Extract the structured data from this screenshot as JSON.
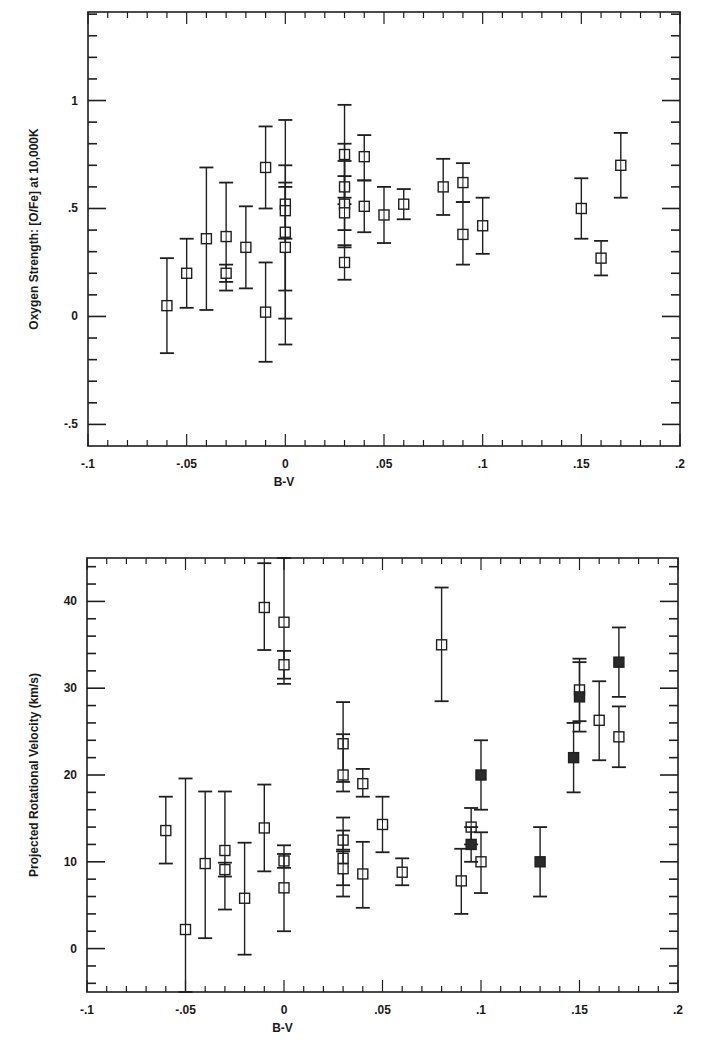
{
  "chart_data": [
    {
      "type": "scatter",
      "title": "",
      "xlabel": "B-V",
      "ylabel": "Oxygen Strength:  [O/Fe] at 10,000K",
      "xlim": [
        -0.1,
        0.2
      ],
      "ylim": [
        -0.6,
        1.41
      ],
      "xticks": [
        -0.1,
        -0.05,
        0,
        0.05,
        0.1,
        0.15,
        0.2
      ],
      "xtick_labels": [
        "-.1",
        "-.05",
        "0",
        ".05",
        ".1",
        ".15",
        ".2"
      ],
      "yticks": [
        -0.5,
        0,
        0.5,
        1
      ],
      "ytick_labels": [
        "-.5",
        "0",
        ".5",
        "1"
      ],
      "grid": false,
      "legend": null,
      "marker": "open-square-with-errorbars",
      "series": [
        {
          "name": "open",
          "filled": false,
          "points": [
            {
              "x": -0.06,
              "y": 0.05,
              "ylo": -0.17,
              "yhi": 0.27
            },
            {
              "x": -0.05,
              "y": 0.2,
              "ylo": 0.04,
              "yhi": 0.36
            },
            {
              "x": -0.04,
              "y": 0.36,
              "ylo": 0.03,
              "yhi": 0.69
            },
            {
              "x": -0.03,
              "y": 0.37,
              "ylo": 0.12,
              "yhi": 0.62
            },
            {
              "x": -0.03,
              "y": 0.2,
              "ylo": 0.16,
              "yhi": 0.24
            },
            {
              "x": -0.02,
              "y": 0.32,
              "ylo": 0.13,
              "yhi": 0.51
            },
            {
              "x": -0.01,
              "y": 0.69,
              "ylo": 0.5,
              "yhi": 0.88
            },
            {
              "x": -0.01,
              "y": 0.02,
              "ylo": -0.21,
              "yhi": 0.25
            },
            {
              "x": 0.0,
              "y": 0.52,
              "ylo": 0.12,
              "yhi": 0.91
            },
            {
              "x": 0.0,
              "y": 0.49,
              "ylo": 0.36,
              "yhi": 0.62
            },
            {
              "x": 0.0,
              "y": 0.39,
              "ylo": -0.01,
              "yhi": 0.7
            },
            {
              "x": 0.0,
              "y": 0.32,
              "ylo": -0.13,
              "yhi": 0.6
            },
            {
              "x": 0.03,
              "y": 0.75,
              "ylo": 0.52,
              "yhi": 0.98
            },
            {
              "x": 0.03,
              "y": 0.6,
              "ylo": 0.55,
              "yhi": 0.65
            },
            {
              "x": 0.03,
              "y": 0.52,
              "ylo": 0.32,
              "yhi": 0.72
            },
            {
              "x": 0.03,
              "y": 0.48,
              "ylo": 0.4,
              "yhi": 0.8
            },
            {
              "x": 0.03,
              "y": 0.25,
              "ylo": 0.17,
              "yhi": 0.33
            },
            {
              "x": 0.04,
              "y": 0.74,
              "ylo": 0.63,
              "yhi": 0.84
            },
            {
              "x": 0.04,
              "y": 0.51,
              "ylo": 0.39,
              "yhi": 0.63
            },
            {
              "x": 0.05,
              "y": 0.47,
              "ylo": 0.34,
              "yhi": 0.6
            },
            {
              "x": 0.06,
              "y": 0.52,
              "ylo": 0.45,
              "yhi": 0.59
            },
            {
              "x": 0.08,
              "y": 0.6,
              "ylo": 0.47,
              "yhi": 0.73
            },
            {
              "x": 0.09,
              "y": 0.62,
              "ylo": 0.53,
              "yhi": 0.71
            },
            {
              "x": 0.09,
              "y": 0.38,
              "ylo": 0.24,
              "yhi": 0.53
            },
            {
              "x": 0.1,
              "y": 0.42,
              "ylo": 0.29,
              "yhi": 0.55
            },
            {
              "x": 0.15,
              "y": 0.5,
              "ylo": 0.36,
              "yhi": 0.64
            },
            {
              "x": 0.16,
              "y": 0.27,
              "ylo": 0.19,
              "yhi": 0.35
            },
            {
              "x": 0.17,
              "y": 0.7,
              "ylo": 0.55,
              "yhi": 0.85
            }
          ]
        }
      ]
    },
    {
      "type": "scatter",
      "title": "",
      "xlabel": "B-V",
      "ylabel": "Projected Rotational Velocity (km/s)",
      "xlim": [
        -0.1,
        0.2
      ],
      "ylim": [
        -5,
        45
      ],
      "xticks": [
        -0.1,
        -0.05,
        0,
        0.05,
        0.1,
        0.15,
        0.2
      ],
      "xtick_labels": [
        "-.1",
        "-.05",
        "0",
        ".05",
        ".1",
        ".15",
        ".2"
      ],
      "yticks": [
        0,
        10,
        20,
        30,
        40
      ],
      "ytick_labels": [
        "0",
        "10",
        "20",
        "30",
        "40"
      ],
      "grid": false,
      "legend": null,
      "marker": "square-with-errorbars",
      "series": [
        {
          "name": "open",
          "filled": false,
          "points": [
            {
              "x": -0.06,
              "y": 13.6,
              "ylo": 9.8,
              "yhi": 17.5
            },
            {
              "x": -0.05,
              "y": 2.2,
              "ylo": -5.0,
              "yhi": 19.6
            },
            {
              "x": -0.04,
              "y": 9.8,
              "ylo": 1.2,
              "yhi": 18.1
            },
            {
              "x": -0.03,
              "y": 11.3,
              "ylo": 4.5,
              "yhi": 18.1
            },
            {
              "x": -0.03,
              "y": 9.1,
              "ylo": 8.3,
              "yhi": 9.9
            },
            {
              "x": -0.02,
              "y": 5.8,
              "ylo": -0.7,
              "yhi": 12.2
            },
            {
              "x": -0.01,
              "y": 39.3,
              "ylo": 34.4,
              "yhi": 44.4
            },
            {
              "x": -0.01,
              "y": 13.9,
              "ylo": 8.9,
              "yhi": 18.9
            },
            {
              "x": 0.0,
              "y": 37.6,
              "ylo": 30.5,
              "yhi": 45.0
            },
            {
              "x": 0.0,
              "y": 32.7,
              "ylo": 31.1,
              "yhi": 34.3
            },
            {
              "x": 0.0,
              "y": 10.1,
              "ylo": 9.3,
              "yhi": 10.9
            },
            {
              "x": 0.0,
              "y": 7.0,
              "ylo": 2.0,
              "yhi": 11.9
            },
            {
              "x": 0.03,
              "y": 23.6,
              "ylo": 19.2,
              "yhi": 28.4
            },
            {
              "x": 0.03,
              "y": 20.0,
              "ylo": 18.1,
              "yhi": 24.7
            },
            {
              "x": 0.03,
              "y": 12.5,
              "ylo": 11.4,
              "yhi": 13.6
            },
            {
              "x": 0.03,
              "y": 10.4,
              "ylo": 7.3,
              "yhi": 15.1
            },
            {
              "x": 0.03,
              "y": 9.2,
              "ylo": 6.0,
              "yhi": 11.2
            },
            {
              "x": 0.04,
              "y": 19.0,
              "ylo": 17.5,
              "yhi": 20.7
            },
            {
              "x": 0.04,
              "y": 8.6,
              "ylo": 4.7,
              "yhi": 12.3
            },
            {
              "x": 0.05,
              "y": 14.3,
              "ylo": 11.1,
              "yhi": 17.5
            },
            {
              "x": 0.06,
              "y": 8.8,
              "ylo": 7.3,
              "yhi": 10.4
            },
            {
              "x": 0.08,
              "y": 35.0,
              "ylo": 28.5,
              "yhi": 41.6
            },
            {
              "x": 0.09,
              "y": 7.8,
              "ylo": 4.0,
              "yhi": 11.5
            },
            {
              "x": 0.095,
              "y": 14.0,
              "ylo": 12.0,
              "yhi": 16.2
            },
            {
              "x": 0.1,
              "y": 10.0,
              "ylo": 6.4,
              "yhi": 13.4
            },
            {
              "x": 0.15,
              "y": 29.8,
              "ylo": 26.2,
              "yhi": 33.4
            },
            {
              "x": 0.16,
              "y": 26.3,
              "ylo": 21.7,
              "yhi": 30.8
            },
            {
              "x": 0.17,
              "y": 24.4,
              "ylo": 20.9,
              "yhi": 27.9
            }
          ]
        },
        {
          "name": "filled",
          "filled": true,
          "points": [
            {
              "x": 0.095,
              "y": 12.0,
              "ylo": 10.0,
              "yhi": 14.0
            },
            {
              "x": 0.1,
              "y": 20.0,
              "ylo": 16.0,
              "yhi": 24.0
            },
            {
              "x": 0.13,
              "y": 10.0,
              "ylo": 6.0,
              "yhi": 14.0
            },
            {
              "x": 0.147,
              "y": 22.0,
              "ylo": 18.0,
              "yhi": 26.0
            },
            {
              "x": 0.15,
              "y": 29.0,
              "ylo": 25.0,
              "yhi": 33.0
            },
            {
              "x": 0.17,
              "y": 33.0,
              "ylo": 29.0,
              "yhi": 37.0
            }
          ]
        }
      ]
    }
  ],
  "layout": {
    "charts": [
      {
        "box": {
          "left": 88,
          "top": 12,
          "right": 680,
          "bottom": 446
        }
      },
      {
        "box": {
          "left": 87,
          "top": 18,
          "right": 678,
          "bottom": 452
        }
      }
    ]
  }
}
